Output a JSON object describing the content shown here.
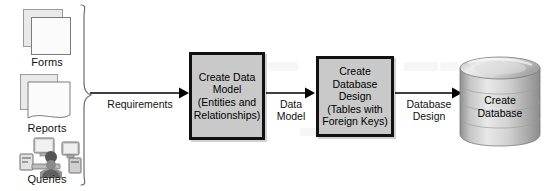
{
  "diagram": {
    "colors": {
      "process_fill": "#c9c9c9",
      "process_border": "#111111",
      "sheet_fill": "#f2f2f2",
      "sheet_border": "#8d8d8d",
      "cylinder_light": "#e6e6e6",
      "cylinder_mid": "#b9b9b9",
      "cylinder_dark": "#8f8f8f",
      "text": "#111111",
      "arrow": "#000000"
    },
    "inputs": [
      {
        "label": "Forms",
        "icon": "stacked-pages-icon"
      },
      {
        "label": "Reports",
        "icon": "stacked-report-pages-icon"
      },
      {
        "label": "Queries",
        "icon": "users-at-computers-icon"
      }
    ],
    "brace": {
      "name": "grouping-brace",
      "orientation": "right-pointing"
    },
    "arrows": [
      {
        "label": "Requirements",
        "from": "inputs",
        "to": "create-data-model"
      },
      {
        "label": "Data\nModel",
        "from": "create-data-model",
        "to": "create-database-design"
      },
      {
        "label": "Database\nDesign",
        "from": "create-database-design",
        "to": "create-database"
      }
    ],
    "processes": [
      {
        "id": "create-data-model",
        "lines": [
          "Create Data",
          "Model",
          "(Entities and",
          "Relationships)"
        ]
      },
      {
        "id": "create-database-design",
        "lines": [
          "Create",
          "Database",
          "Design",
          "(Tables with",
          "Foreign Keys)"
        ]
      }
    ],
    "datastore": {
      "id": "create-database",
      "shape": "cylinder-stack",
      "lines": [
        "Create",
        "Database"
      ]
    }
  }
}
